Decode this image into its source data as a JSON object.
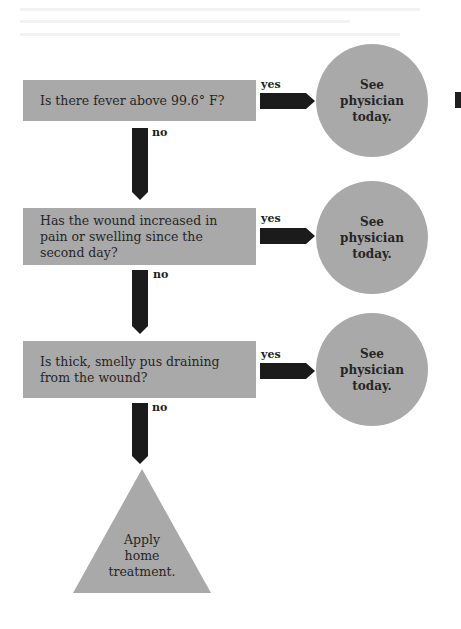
{
  "flowchart": {
    "colors": {
      "shape_fill": "#a9a9a9",
      "arrow_fill": "#1b1b1b",
      "text": "#262626",
      "background": "#ffffff"
    },
    "decisions": [
      {
        "question": "Is there fever above 99.6° F?",
        "yes_label": "yes",
        "no_label": "no",
        "yes_outcome": [
          "See",
          "physician",
          "today."
        ]
      },
      {
        "question": "Has the wound increased in pain or swelling since the second day?",
        "yes_label": "yes",
        "no_label": "no",
        "yes_outcome": [
          "See",
          "physician",
          "today."
        ]
      },
      {
        "question": "Is thick, smelly pus draining from the wound?",
        "yes_label": "yes",
        "no_label": "no",
        "yes_outcome": [
          "See",
          "physician",
          "today."
        ]
      }
    ],
    "final_outcome": [
      "Apply",
      "home",
      "treatment."
    ]
  }
}
